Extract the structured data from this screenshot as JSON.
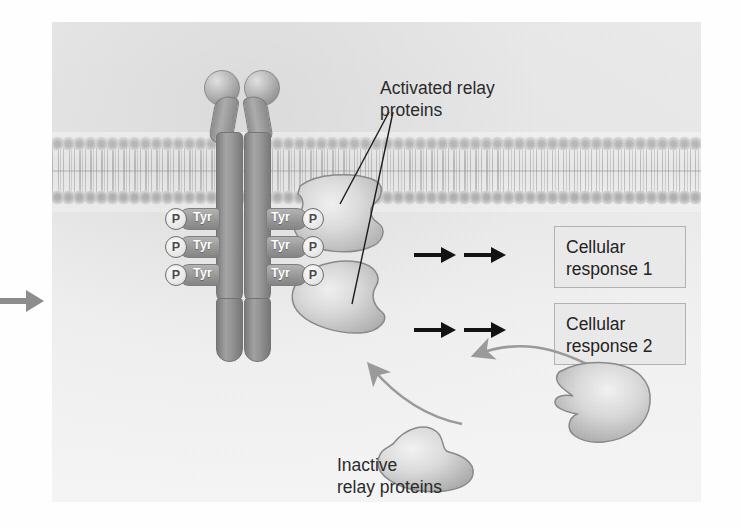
{
  "diagram": {
    "type": "cell-signaling-pathway",
    "title_visible": false,
    "labels": {
      "activated_relay_line1": "Activated relay",
      "activated_relay_line2": "proteins",
      "inactive_relay_line1": "Inactive",
      "inactive_relay_line2": "relay proteins"
    },
    "response_boxes": [
      {
        "line1": "Cellular",
        "line2": "response 1"
      },
      {
        "line1": "Cellular",
        "line2": "response 2"
      }
    ],
    "receptor": {
      "name": "receptor-tyrosine-kinase-dimer",
      "ligand_count": 2,
      "phosphorylation_sites_per_monomer": 3,
      "tyrosine_label": "Tyr",
      "phosphate_label": "P",
      "tyr_rows": [
        {
          "left_p": "P",
          "left_tyr": "Tyr",
          "right_tyr": "Tyr",
          "right_p": "P"
        },
        {
          "left_p": "P",
          "left_tyr": "Tyr",
          "right_tyr": "Tyr",
          "right_p": "P"
        },
        {
          "left_p": "P",
          "left_tyr": "Tyr",
          "right_tyr": "Tyr",
          "right_p": "P"
        }
      ]
    },
    "membrane": {
      "name": "phospholipid-bilayer",
      "head_rows": 2
    },
    "inactive_protein_count": 2,
    "activated_protein_count": 2,
    "colors": {
      "panel_background": "#ebebeb",
      "membrane_head": "#9d9d9d",
      "receptor_body": "#9a9a9a",
      "text": "#2a2a2a",
      "box_border": "#b3b3b3",
      "box_fill": "#ebebeb",
      "black_arrow": "#111111",
      "gray_arrow": "#9b9b9b",
      "protein_fill": "#d8d8d8",
      "protein_outline": "#8a8a8a"
    },
    "icons": {
      "left_entry_arrow": "arrow-right-icon",
      "black_pathway_arrow": "arrow-right-icon",
      "recruitment_arrow": "curved-arrow-icon",
      "leader_line": "pointer-line-icon"
    }
  }
}
